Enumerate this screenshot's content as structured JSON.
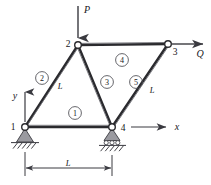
{
  "figure": {
    "type": "engineering-truss-diagram"
  },
  "loads": [
    {
      "id": "P",
      "label": "P",
      "applied_at_node": "2",
      "direction": "down"
    },
    {
      "id": "Q",
      "label": "Q",
      "applied_at_node": "3",
      "direction": "right"
    }
  ],
  "axes": {
    "x_label": "x",
    "y_label": "y",
    "origin_node": "1"
  },
  "nodes": [
    {
      "id": "1",
      "label": "1",
      "support": "pin"
    },
    {
      "id": "2",
      "label": "2",
      "support": "none"
    },
    {
      "id": "3",
      "label": "3",
      "support": "none"
    },
    {
      "id": "4",
      "label": "4",
      "support": "roller"
    }
  ],
  "elements": [
    {
      "id": "1",
      "label": "1"
    },
    {
      "id": "2",
      "label": "2"
    },
    {
      "id": "3",
      "label": "3"
    },
    {
      "id": "4",
      "label": "4"
    },
    {
      "id": "5",
      "label": "5"
    }
  ],
  "length_labels": {
    "left_diagonal": "L",
    "center_diagonal": "L",
    "right_diagonal": "L",
    "bottom_dimension": "L"
  },
  "colors": {
    "member": "#2a2a2e",
    "node_fill": "#ffffff",
    "support_fill": "#9a9aa0",
    "text": "#16161a",
    "background": "#ffffff"
  }
}
